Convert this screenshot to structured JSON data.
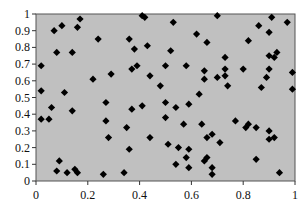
{
  "chart_data": {
    "type": "scatter",
    "title": "",
    "xlabel": "",
    "ylabel": "",
    "xlim": [
      0,
      1
    ],
    "ylim": [
      0,
      1
    ],
    "grid": false,
    "legend": null,
    "marker": "diamond",
    "colors": {
      "plot_background": "#c0c0c0",
      "marker": "#000000",
      "axis": "#555555"
    },
    "x_ticks": [
      "0",
      "0.2",
      "0.4",
      "0.6",
      "0.8",
      "1"
    ],
    "y_ticks": [
      "0",
      "0.1",
      "0.2",
      "0.3",
      "0.4",
      "0.5",
      "0.6",
      "0.7",
      "0.8",
      "0.9",
      "1"
    ],
    "series": [
      {
        "name": "points",
        "points": [
          [
            0.02,
            0.69
          ],
          [
            0.02,
            0.54
          ],
          [
            0.06,
            0.44
          ],
          [
            0.02,
            0.37
          ],
          [
            0.05,
            0.37
          ],
          [
            0.07,
            0.9
          ],
          [
            0.1,
            0.93
          ],
          [
            0.17,
            0.97
          ],
          [
            0.16,
            0.92
          ],
          [
            0.08,
            0.77
          ],
          [
            0.14,
            0.77
          ],
          [
            0.11,
            0.53
          ],
          [
            0.14,
            0.42
          ],
          [
            0.22,
            0.61
          ],
          [
            0.24,
            0.85
          ],
          [
            0.09,
            0.12
          ],
          [
            0.08,
            0.06
          ],
          [
            0.12,
            0.05
          ],
          [
            0.15,
            0.07
          ],
          [
            0.16,
            0.05
          ],
          [
            0.26,
            0.04
          ],
          [
            0.34,
            0.05
          ],
          [
            0.27,
            0.36
          ],
          [
            0.28,
            0.26
          ],
          [
            0.29,
            0.64
          ],
          [
            0.36,
            0.85
          ],
          [
            0.38,
            0.79
          ],
          [
            0.43,
            0.81
          ],
          [
            0.41,
            0.99
          ],
          [
            0.42,
            0.98
          ],
          [
            0.39,
            0.69
          ],
          [
            0.37,
            0.67
          ],
          [
            0.44,
            0.63
          ],
          [
            0.48,
            0.57
          ],
          [
            0.27,
            0.47
          ],
          [
            0.37,
            0.43
          ],
          [
            0.41,
            0.45
          ],
          [
            0.35,
            0.32
          ],
          [
            0.44,
            0.26
          ],
          [
            0.36,
            0.19
          ],
          [
            0.53,
            0.95
          ],
          [
            0.62,
            0.88
          ],
          [
            0.66,
            0.83
          ],
          [
            0.52,
            0.78
          ],
          [
            0.7,
            0.99
          ],
          [
            0.73,
            0.74
          ],
          [
            0.5,
            0.69
          ],
          [
            0.58,
            0.69
          ],
          [
            0.65,
            0.66
          ],
          [
            0.65,
            0.61
          ],
          [
            0.73,
            0.67
          ],
          [
            0.73,
            0.63
          ],
          [
            0.7,
            0.62
          ],
          [
            0.63,
            0.52
          ],
          [
            0.5,
            0.47
          ],
          [
            0.54,
            0.44
          ],
          [
            0.59,
            0.46
          ],
          [
            0.5,
            0.38
          ],
          [
            0.57,
            0.34
          ],
          [
            0.64,
            0.34
          ],
          [
            0.68,
            0.28
          ],
          [
            0.66,
            0.26
          ],
          [
            0.71,
            0.23
          ],
          [
            0.51,
            0.22
          ],
          [
            0.55,
            0.2
          ],
          [
            0.59,
            0.19
          ],
          [
            0.58,
            0.14
          ],
          [
            0.66,
            0.14
          ],
          [
            0.65,
            0.12
          ],
          [
            0.54,
            0.1
          ],
          [
            0.59,
            0.08
          ],
          [
            0.68,
            0.08
          ],
          [
            0.68,
            0.04
          ],
          [
            0.86,
            0.93
          ],
          [
            0.9,
            0.89
          ],
          [
            0.97,
            0.95
          ],
          [
            0.91,
            0.98
          ],
          [
            0.82,
            0.84
          ],
          [
            0.9,
            0.75
          ],
          [
            0.93,
            0.77
          ],
          [
            0.92,
            0.74
          ],
          [
            0.8,
            0.67
          ],
          [
            0.9,
            0.67
          ],
          [
            0.89,
            0.62
          ],
          [
            0.99,
            0.65
          ],
          [
            0.74,
            0.57
          ],
          [
            0.87,
            0.56
          ],
          [
            0.99,
            0.55
          ],
          [
            0.77,
            0.36
          ],
          [
            0.82,
            0.34
          ],
          [
            0.81,
            0.32
          ],
          [
            0.85,
            0.32
          ],
          [
            0.9,
            0.3
          ],
          [
            0.92,
            0.26
          ],
          [
            0.9,
            0.25
          ],
          [
            0.85,
            0.13
          ],
          [
            0.94,
            0.05
          ]
        ]
      }
    ]
  }
}
